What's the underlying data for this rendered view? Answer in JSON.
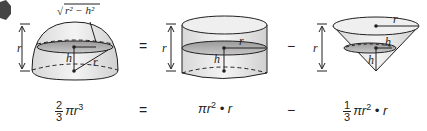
{
  "badge": {
    "shape": "hexagon",
    "color": "#444444"
  },
  "figures": [
    {
      "name": "hemisphere",
      "labels": {
        "height": "r",
        "slice_radius": "√(r² − h²)",
        "h": "h",
        "radius": "r"
      }
    },
    {
      "name": "cylinder",
      "labels": {
        "height": "r",
        "radius": "r",
        "h": "h"
      }
    },
    {
      "name": "cone",
      "labels": {
        "height": "r",
        "radius": "r",
        "h_slice": "h",
        "h_side": "h"
      }
    }
  ],
  "operators": {
    "equals_top": "=",
    "minus_top": "−",
    "equals_bottom": "=",
    "minus_bottom": "−"
  },
  "formulas": {
    "hemisphere": {
      "frac_num": "2",
      "frac_den": "3",
      "rest": "πr",
      "exp": "3"
    },
    "cylinder": {
      "base": "πr",
      "exp": "2",
      "tail": " • r"
    },
    "cone": {
      "frac_num": "1",
      "frac_den": "3",
      "base": "πr",
      "exp": "2",
      "tail": " • r"
    }
  },
  "sqrt_label": "r² − h²"
}
